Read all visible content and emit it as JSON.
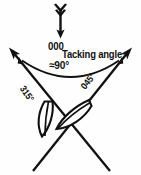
{
  "diagram": {
    "background_color": "#fefefe",
    "ink_color": "#111111",
    "labels": {
      "heading": "000",
      "tacking_angle": "Tacking angle",
      "angle_value": "≈90°",
      "port_tack_bearing": "315°",
      "starboard_tack_bearing": "045°"
    },
    "elements": {
      "wind_arrow": "downward arrow with fletching",
      "port_ray": "arrow to upper-left at 315 degrees",
      "starboard_ray": "arrow to upper-right at 045 degrees",
      "angle_arc": "double-headed arc spanning the two rays",
      "port_boat": "sailboat hull outline on port tack",
      "starboard_boat": "sailboat hull outline on starboard tack"
    }
  }
}
